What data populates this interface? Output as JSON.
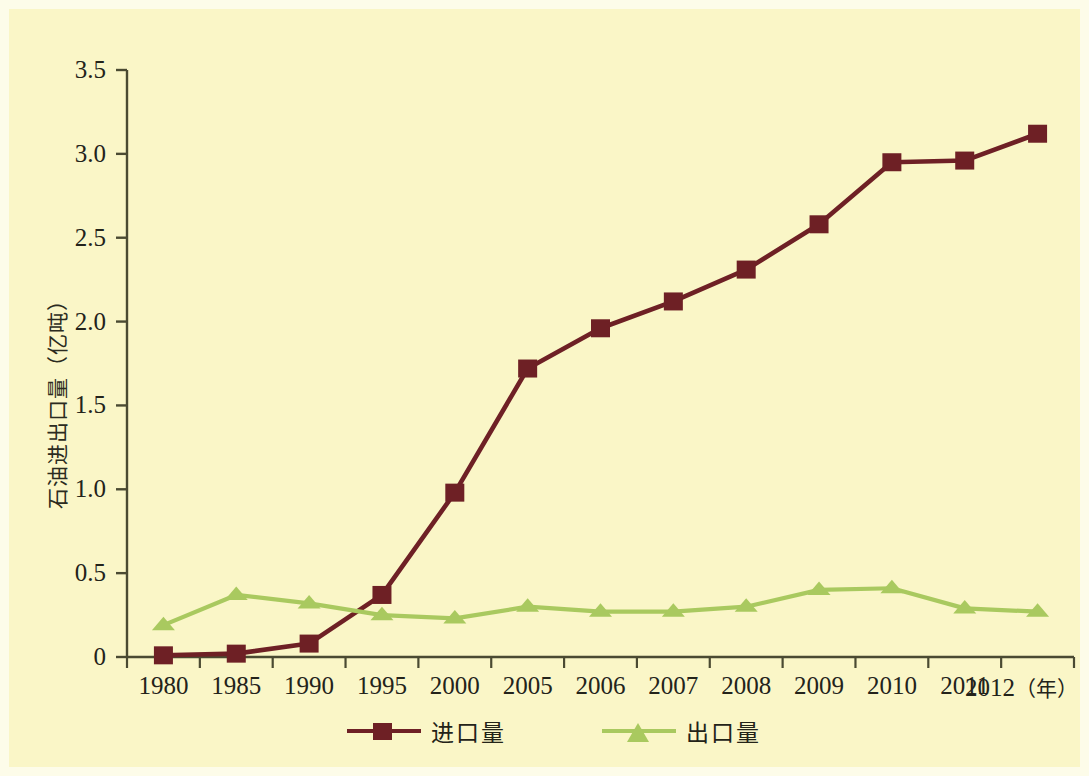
{
  "chart_data": {
    "type": "line",
    "title": "",
    "xlabel": "年",
    "ylabel": "石油进出口量（亿吨）",
    "categories": [
      "1980",
      "1985",
      "1990",
      "1995",
      "2000",
      "2005",
      "2006",
      "2007",
      "2008",
      "2009",
      "2010",
      "2011",
      "2012"
    ],
    "ytick_labels": [
      "0",
      "0.5",
      "1.0",
      "1.5",
      "2.0",
      "2.5",
      "3.0",
      "3.5"
    ],
    "ytick_values": [
      0,
      0.5,
      1.0,
      1.5,
      2.0,
      2.5,
      3.0,
      3.5
    ],
    "ylim": [
      0,
      3.5
    ],
    "grid": false,
    "legend_position": "bottom-center",
    "series": [
      {
        "name": "进口量",
        "color": "#6e2025",
        "marker": "square",
        "values": [
          0.01,
          0.02,
          0.08,
          0.37,
          0.98,
          1.72,
          1.96,
          2.12,
          2.31,
          2.58,
          2.95,
          2.96,
          3.12
        ]
      },
      {
        "name": "出口量",
        "color": "#a9c95f",
        "marker": "triangle",
        "values": [
          0.19,
          0.37,
          0.32,
          0.25,
          0.23,
          0.3,
          0.27,
          0.27,
          0.3,
          0.4,
          0.41,
          0.29,
          0.27
        ]
      }
    ]
  },
  "axis": {
    "x_unit_label": "（年）",
    "axis_color": "#4a4a32"
  },
  "legend": {
    "items": [
      {
        "label": "进口量",
        "color": "#6e2025",
        "marker": "square"
      },
      {
        "label": "出口量",
        "color": "#a9c95f",
        "marker": "triangle"
      }
    ]
  },
  "colors": {
    "background": "#faf6c7",
    "frame": "#fdfce9",
    "import_series": "#6e2025",
    "export_series": "#a9c95f",
    "text": "#23231a"
  }
}
